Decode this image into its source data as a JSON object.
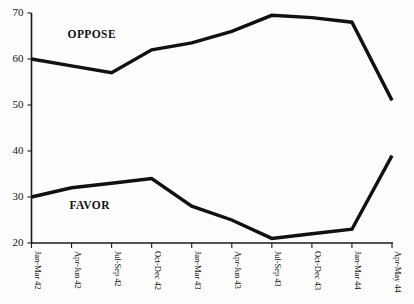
{
  "chart_data": {
    "type": "line",
    "title": "",
    "xlabel": "",
    "ylabel": "",
    "ylim": [
      20,
      70
    ],
    "yticks": [
      20,
      30,
      40,
      50,
      60,
      70
    ],
    "grid": false,
    "legend_position": "inline-annotation",
    "categories": [
      "Jan-Mar 42",
      "Apr-Jun 42",
      "Jul-Sep 42",
      "Oct-Dec 42",
      "Jan-Mar 43",
      "Apr-Jun 43",
      "Jul-Sep 43",
      "Oct-Dec 43",
      "Jan-Mar 44",
      "Apr-May 44"
    ],
    "series": [
      {
        "name": "OPPOSE",
        "color": "#111111",
        "values": [
          60,
          58.5,
          57,
          62,
          63.5,
          66,
          69.5,
          69,
          68,
          51
        ]
      },
      {
        "name": "FAVOR",
        "color": "#111111",
        "values": [
          30,
          32,
          33,
          34,
          28,
          25,
          21,
          22,
          23,
          39
        ]
      }
    ],
    "annotations": [
      {
        "text": "OPPOSE",
        "x_index": 0.9,
        "value": 64.6
      },
      {
        "text": "FAVOR",
        "x_index": 0.95,
        "value": 27.3
      }
    ]
  }
}
